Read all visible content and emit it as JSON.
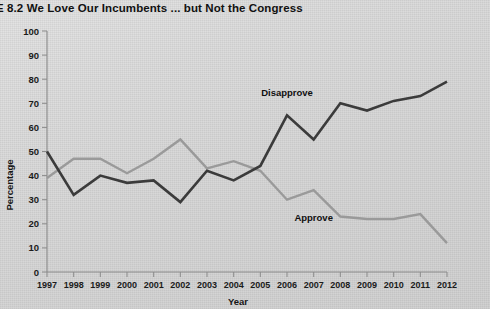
{
  "figure": {
    "title": "E 8.2  We Love Our Incumbents ... but Not the Congress"
  },
  "chart_data": {
    "type": "line",
    "title": "E 8.2  We Love Our Incumbents ... but Not the Congress",
    "xlabel": "Year",
    "ylabel": "Percentage",
    "xlim": [
      1997,
      2012
    ],
    "ylim": [
      0,
      100
    ],
    "grid": false,
    "legend_position": "inline-annotations",
    "x": [
      1997,
      1998,
      1999,
      2000,
      2001,
      2002,
      2003,
      2004,
      2005,
      2006,
      2007,
      2008,
      2009,
      2010,
      2011,
      2012
    ],
    "xtick_labels": [
      "1997",
      "1998",
      "1999",
      "2000",
      "2001",
      "2002",
      "2003",
      "2004",
      "2005",
      "2006",
      "2007",
      "2008",
      "2009",
      "2010",
      "2011",
      "2012"
    ],
    "ytick_labels": [
      "0",
      "10",
      "20",
      "30",
      "40",
      "50",
      "60",
      "70",
      "80",
      "90",
      "100"
    ],
    "ytick_values": [
      0,
      10,
      20,
      30,
      40,
      50,
      60,
      70,
      80,
      90,
      100
    ],
    "series": [
      {
        "name": "Disapprove",
        "color": "#3b3b3b",
        "values": [
          50,
          32,
          40,
          37,
          38,
          29,
          42,
          38,
          44,
          65,
          55,
          70,
          67,
          71,
          73,
          79
        ]
      },
      {
        "name": "Approve",
        "color": "#9a9a9a",
        "values": [
          39,
          47,
          47,
          41,
          47,
          55,
          43,
          46,
          42,
          30,
          34,
          23,
          22,
          22,
          24,
          12
        ]
      }
    ],
    "annotations": [
      {
        "text": "Disapprove",
        "x": 2006,
        "y": 73
      },
      {
        "text": "Approve",
        "x": 2007,
        "y": 21
      }
    ]
  }
}
